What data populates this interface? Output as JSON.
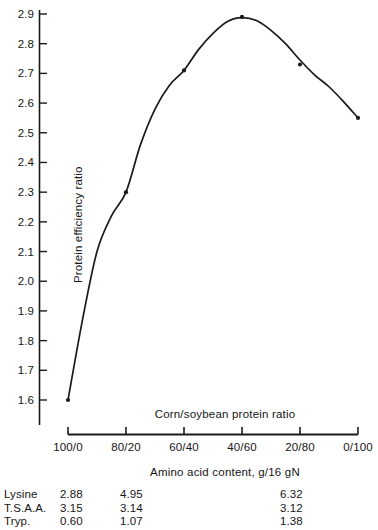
{
  "chart_data": {
    "type": "line",
    "title": "",
    "xlabel": "Corn/soybean protein ratio",
    "xlabel_secondary": "Amino acid content, g/16 gN",
    "ylabel": "Protein efficiency ratio",
    "categories": [
      "100/0",
      "80/20",
      "60/40",
      "40/60",
      "20/80",
      "0/100"
    ],
    "x": [
      0,
      1,
      2,
      3,
      4,
      5
    ],
    "values": [
      1.6,
      2.3,
      2.71,
      2.89,
      2.73,
      2.55
    ],
    "series": [
      {
        "name": "Protein efficiency ratio",
        "values": [
          1.6,
          2.3,
          2.71,
          2.89,
          2.73,
          2.55
        ]
      }
    ],
    "fitted_curve": {
      "description": "smooth fitted curve rising from 1.60 at 100/0 to a maximum near 2.89 at 40/60, then declining to 2.55 at 0/100",
      "points": [
        [
          0.0,
          1.6
        ],
        [
          0.25,
          1.87
        ],
        [
          0.5,
          2.1
        ],
        [
          0.75,
          2.22
        ],
        [
          1.0,
          2.3
        ],
        [
          1.25,
          2.46
        ],
        [
          1.5,
          2.58
        ],
        [
          1.75,
          2.66
        ],
        [
          2.0,
          2.71
        ],
        [
          2.25,
          2.78
        ],
        [
          2.5,
          2.835
        ],
        [
          2.75,
          2.875
        ],
        [
          3.0,
          2.888
        ],
        [
          3.25,
          2.878
        ],
        [
          3.5,
          2.845
        ],
        [
          3.75,
          2.8
        ],
        [
          4.0,
          2.745
        ],
        [
          4.25,
          2.695
        ],
        [
          4.5,
          2.655
        ],
        [
          4.75,
          2.605
        ],
        [
          5.0,
          2.55
        ]
      ]
    },
    "ylim": [
      1.6,
      2.9
    ],
    "yticks": [
      2.9,
      2.8,
      2.7,
      2.6,
      2.5,
      2.4,
      2.3,
      2.2,
      2.1,
      2.0,
      1.9,
      1.8,
      1.7,
      1.6
    ],
    "ytick_labels": [
      "2.9",
      "2.8",
      "2.7",
      "2.6",
      "2.5",
      "2.4",
      "2.3",
      "2.2",
      "2.1",
      "2.0",
      "1.9",
      "1.8",
      "1.7",
      "1.6"
    ],
    "grid": false,
    "legend": "none",
    "marker": "filled-circle",
    "line_color": "#1a1a1a",
    "marker_color": "#1a1a1a",
    "axis_color": "#1a1a1a",
    "background_color": "#ffffff"
  },
  "amino_acid_table": {
    "caption": "Amino acid content, g/16 gN",
    "rows": [
      {
        "name": "Lysine",
        "c1": "2.88",
        "c2": "4.95",
        "c3": "6.32"
      },
      {
        "name": "T.S.A.A.",
        "c1": "3.15",
        "c2": "3.14",
        "c3": "3.12"
      },
      {
        "name": "Tryp.",
        "c1": "0.60",
        "c2": "1.07",
        "c3": "1.38"
      }
    ]
  }
}
